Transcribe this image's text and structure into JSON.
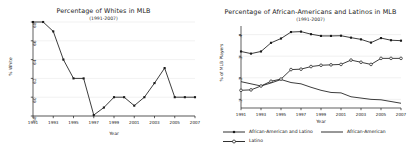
{
  "figure": {
    "background": "#ffffff",
    "ink": "#1a1a1a",
    "grid_color": "#e8e8e8"
  },
  "chart_data": [
    {
      "type": "line",
      "panel": "left",
      "title": "Percentage of Whites in MLB",
      "subtitle": "(1991-2007)",
      "xlabel": "Year",
      "ylabel": "% White",
      "grid": true,
      "legend_position": "none",
      "xlim": [
        1991,
        2007
      ],
      "ylim": [
        58,
        68
      ],
      "xticks": [
        "1991",
        "1993",
        "1995",
        "1997",
        "1999",
        "2001",
        "2003",
        "2005",
        "2007"
      ],
      "yticks": [
        "58",
        "60",
        "62",
        "64",
        "66",
        "68"
      ],
      "x": [
        1991,
        1992,
        1993,
        1994,
        1995,
        1996,
        1997,
        1998,
        1999,
        2000,
        2001,
        2002,
        2003,
        2004,
        2005,
        2006,
        2007
      ],
      "series": [
        {
          "name": "% White",
          "marker": "filled-square",
          "values": [
            68.0,
            68.0,
            67.0,
            64.0,
            62.0,
            62.0,
            58.1,
            58.9,
            60.0,
            60.0,
            59.1,
            60.0,
            61.5,
            63.1,
            60.0,
            60.0,
            60.0
          ]
        }
      ]
    },
    {
      "type": "line",
      "panel": "right",
      "title": "Percentage of African-Americans and Latinos in MLB",
      "subtitle": "(1991-2007)",
      "xlabel": "Year",
      "ylabel": "% of MLB Players",
      "grid": true,
      "legend_position": "bottom",
      "xlim": [
        1991,
        2007
      ],
      "ylim": [
        0.06,
        0.44
      ],
      "xticks": [
        "1991",
        "1993",
        "1995",
        "1997",
        "1999",
        "2001",
        "2003",
        "2005",
        "2007"
      ],
      "yticks": [
        ".1",
        ".2",
        ".3",
        ".4"
      ],
      "x": [
        1991,
        1992,
        1993,
        1994,
        1995,
        1996,
        1997,
        1998,
        1999,
        2000,
        2001,
        2002,
        2003,
        2004,
        2005,
        2006,
        2007
      ],
      "series": [
        {
          "name": "African-American and Latino",
          "marker": "filled-square",
          "values": [
            0.322,
            0.312,
            0.322,
            0.362,
            0.382,
            0.412,
            0.414,
            0.402,
            0.394,
            0.394,
            0.395,
            0.386,
            0.378,
            0.363,
            0.384,
            0.374,
            0.372
          ]
        },
        {
          "name": "African-American",
          "marker": "none",
          "values": [
            0.182,
            0.172,
            0.162,
            0.176,
            0.192,
            0.178,
            0.172,
            0.156,
            0.142,
            0.132,
            0.13,
            0.112,
            0.106,
            0.1,
            0.098,
            0.09,
            0.082
          ]
        },
        {
          "name": "Latino",
          "marker": "open-circle",
          "values": [
            0.142,
            0.144,
            0.162,
            0.184,
            0.194,
            0.238,
            0.24,
            0.252,
            0.258,
            0.26,
            0.262,
            0.282,
            0.272,
            0.262,
            0.29,
            0.29,
            0.29
          ]
        }
      ]
    }
  ]
}
